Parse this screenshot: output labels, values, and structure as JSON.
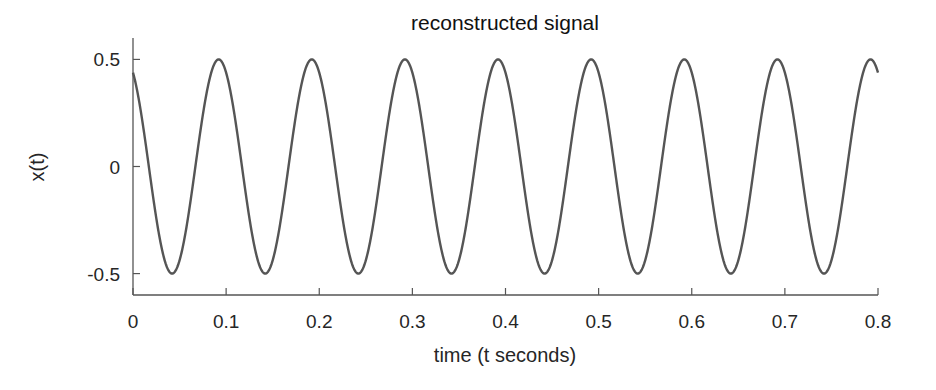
{
  "chart_data": {
    "type": "line",
    "title": "reconstructed signal",
    "xlabel": "time (t seconds)",
    "ylabel": "x(t)",
    "xlim": [
      0,
      0.8
    ],
    "ylim": [
      -0.6,
      0.6
    ],
    "xticks": [
      0,
      0.1,
      0.2,
      0.3,
      0.4,
      0.5,
      0.6,
      0.7,
      0.8
    ],
    "xtick_labels": [
      "0",
      "0.1",
      "0.2",
      "0.3",
      "0.4",
      "0.5",
      "0.6",
      "0.7",
      "0.8"
    ],
    "yticks": [
      0.5,
      0,
      -0.5
    ],
    "ytick_labels": [
      "0.5",
      "0",
      "-0.5"
    ],
    "grid": false,
    "box": false,
    "series": [
      {
        "name": "reconstructed signal",
        "color": "#555555",
        "model": {
          "form": "A*cos(2*pi*f*(t - t0))",
          "A": 0.5,
          "f": 10,
          "t0": 0.092
        },
        "peaks_t": [
          0.092,
          0.192,
          0.292,
          0.392,
          0.492,
          0.592,
          0.692,
          0.792
        ],
        "troughs_t": [
          0.042,
          0.142,
          0.242,
          0.342,
          0.442,
          0.542,
          0.642,
          0.742
        ],
        "x": [
          0,
          0.042,
          0.092,
          0.142,
          0.192,
          0.242,
          0.292,
          0.342,
          0.392,
          0.442,
          0.492,
          0.542,
          0.592,
          0.642,
          0.692,
          0.742,
          0.792,
          0.8
        ],
        "y": [
          0.44,
          -0.5,
          0.5,
          -0.5,
          0.5,
          -0.5,
          0.5,
          -0.5,
          0.5,
          -0.5,
          0.5,
          -0.5,
          0.5,
          -0.5,
          0.5,
          -0.5,
          0.5,
          0.47
        ]
      }
    ]
  }
}
